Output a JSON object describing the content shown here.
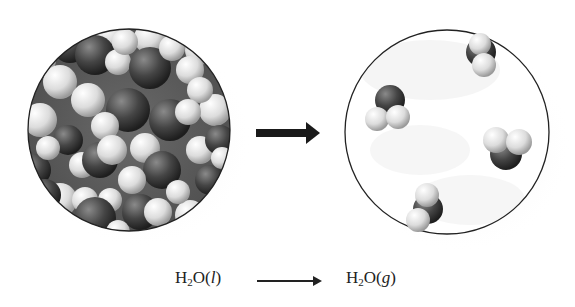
{
  "figure": {
    "left_panel": {
      "label": "liquid water",
      "state": "l",
      "description": "densely packed water molecules"
    },
    "transition_arrow": {
      "icon": "arrow-right-icon",
      "color": "#1a1a1a"
    },
    "right_panel": {
      "label": "water vapor",
      "state": "g",
      "molecule_count": 4,
      "description": "widely spaced water molecules"
    },
    "colors": {
      "oxygen": "#3a3a3a",
      "hydrogen": "#e6e6e6",
      "circle_border": "#222222",
      "background": "#ffffff"
    }
  },
  "equation": {
    "reactant": {
      "formula": "H",
      "sub": "2",
      "rest": "O(",
      "phase": "l",
      "close": ")"
    },
    "product": {
      "formula": "H",
      "sub": "2",
      "rest": "O(",
      "phase": "g",
      "close": ")"
    },
    "arrow_icon": "long-arrow-right-icon"
  }
}
